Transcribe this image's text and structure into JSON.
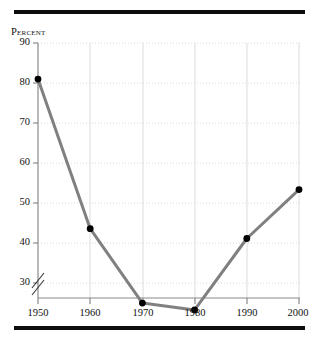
{
  "chart_data": {
    "type": "line",
    "title": "",
    "subtitle": "",
    "xlabel": "",
    "ylabel": "Percent",
    "x": [
      1950,
      1960,
      1970,
      1980,
      1990,
      2000
    ],
    "categories": [
      "1950",
      "1960",
      "1970",
      "1980",
      "1990",
      "2000"
    ],
    "values": [
      81.5,
      46.3,
      28.8,
      27.2,
      44.0,
      55.5
    ],
    "series": [
      {
        "name": "Percent",
        "values": [
          81.5,
          46.3,
          28.8,
          27.2,
          44.0,
          55.5
        ]
      }
    ],
    "xlim": [
      1950,
      2000
    ],
    "ylim": [
      30,
      90
    ],
    "y_axis_break": true,
    "y_axis_break_label": "//",
    "xticks": [
      "1950",
      "1960",
      "1970",
      "1980",
      "1990",
      "2000"
    ],
    "yticks": [
      "90",
      "80",
      "70",
      "60",
      "50",
      "40",
      "30"
    ],
    "grid": {
      "horizontal": "dotted",
      "vertical": "solid",
      "color": "#d9d9d9"
    },
    "legend": {
      "visible": false,
      "position": "none",
      "entries": []
    },
    "annotations": [],
    "style": {
      "line_color": "#808080",
      "marker_color": "#000000",
      "marker_shape": "circle",
      "axis_color": "#888888",
      "rule_color": "#0d0d0d",
      "background": "#ffffff",
      "text_color": "#111111"
    }
  },
  "figure": {
    "top_rule": "",
    "bottom_rule": "",
    "y_axis_caption": "Percent"
  }
}
